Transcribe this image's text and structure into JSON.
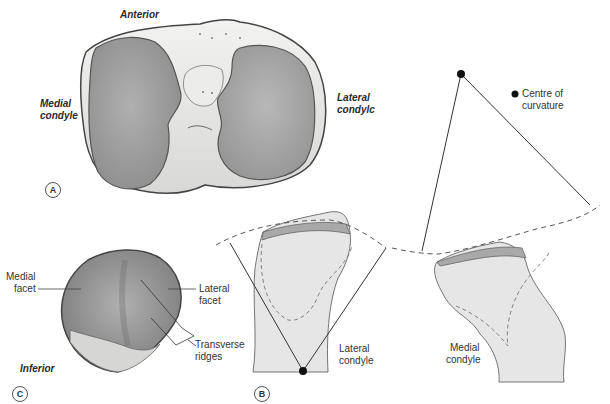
{
  "figure": {
    "panels": {
      "A": "A",
      "B": "B",
      "C": "C"
    },
    "panel_a": {
      "labels": {
        "anterior": "Anterior",
        "medial_condyle_line1": "Medial",
        "medial_condyle_line2": "condyle",
        "lateral_condyle_line1": "Lateral",
        "lateral_condyle_line2": "condylc"
      }
    },
    "panel_c": {
      "labels": {
        "medial_facet_line1": "Medial",
        "medial_facet_line2": "facet",
        "lateral_facet_line1": "Lateral",
        "lateral_facet_line2": "facet",
        "transverse_ridges_line1": "Transverse",
        "transverse_ridges_line2": "ridges",
        "inferior": "Inferior"
      }
    },
    "panel_b": {
      "labels": {
        "lateral_condyle_line1": "Lateral",
        "lateral_condyle_line2": "condyle",
        "medial_condyle_line1": "Medial",
        "medial_condyle_line2": "condyle"
      },
      "legend": {
        "line1": "Centre of",
        "line2": "curvature"
      }
    },
    "colors": {
      "bone_fill": "#e6e6e6",
      "cartilage_fill": "#a9a9a9",
      "plateau_fill": "#9e9e9e",
      "outline": "#555555",
      "line": "#444444"
    }
  }
}
